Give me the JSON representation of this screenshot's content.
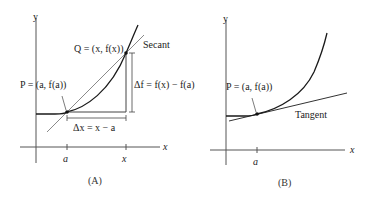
{
  "panel_a": {
    "caption": "(A)",
    "y_axis_label": "y",
    "x_axis_label": "x",
    "tick_a": "a",
    "tick_x": "x",
    "point_p": "P = (a, f(a))",
    "point_q": "Q = (x, f(x))",
    "secant_label": "Secant",
    "delta_x": "Δx = x − a",
    "delta_f": "Δf = f(x) − f(a)"
  },
  "panel_b": {
    "caption": "(B)",
    "y_axis_label": "y",
    "x_axis_label": "x",
    "tick_a": "a",
    "point_p": "P = (a, f(a))",
    "tangent_label": "Tangent"
  },
  "colors": {
    "curve": "#1a1a1a",
    "secant": "#8a8a8a",
    "axes": "#444444"
  }
}
